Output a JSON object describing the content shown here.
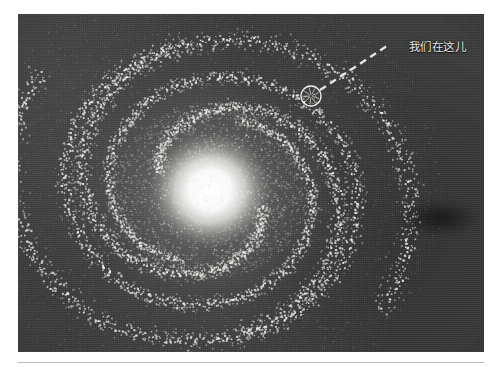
{
  "figure": {
    "kind": "photographic-plate",
    "background_color": "#3a3a3a",
    "core_color": "#ffffff",
    "star_color": "#f2f2ee",
    "plate": {
      "x": 18,
      "y": 14,
      "width": 466,
      "height": 338
    }
  },
  "annotation": {
    "label": "我们在这儿",
    "label_color": "#e8e8e4",
    "marker": {
      "name": "sun-position-marker",
      "shape": "circle",
      "cx": 293,
      "cy": 82,
      "r": 10,
      "stroke_color": "#efefe8"
    },
    "leader_line": {
      "name": "dashed-leader-line",
      "x1": 302,
      "y1": 76,
      "x2": 372,
      "y2": 30,
      "style": "dashed",
      "color": "#e6e6e0"
    }
  },
  "galaxy": {
    "center": {
      "x": 192,
      "y": 176
    },
    "core": {
      "rx": 62,
      "ry": 58
    },
    "arms": [
      {
        "name": "arm-1",
        "start_angle": 20,
        "turns": 1.05,
        "r_start": 52,
        "r_end": 206,
        "width": 12,
        "density": 520
      },
      {
        "name": "arm-2",
        "start_angle": 200,
        "turns": 1.05,
        "r_start": 52,
        "r_end": 206,
        "width": 12,
        "density": 520
      },
      {
        "name": "arm-3",
        "start_angle": 110,
        "turns": 0.92,
        "r_start": 78,
        "r_end": 158,
        "width": 10,
        "density": 380
      },
      {
        "name": "arm-4",
        "start_angle": 290,
        "turns": 0.92,
        "r_start": 78,
        "r_end": 158,
        "width": 10,
        "density": 380
      }
    ]
  },
  "footer": {
    "rule_color": "#b9b9b9"
  }
}
